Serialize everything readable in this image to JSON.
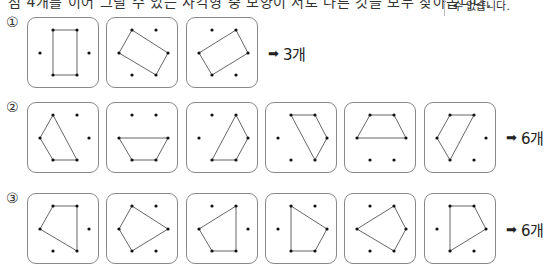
{
  "header": {
    "instruction_partial": "점 4개를 이어 그릴 수 있는 사각형 중 모양이 서로 다른 것을 모두 찾아봅니다.",
    "side_note": "수 없습니다."
  },
  "dot_layout": {
    "description": "6 dots arranged as a hexagon: 0=top-left,1=top-right,2=right,3=bottom-right,4=bottom-left,5=left",
    "points": [
      [
        25,
        12
      ],
      [
        49,
        12
      ],
      [
        61,
        35
      ],
      [
        49,
        57
      ],
      [
        25,
        57
      ],
      [
        12,
        35
      ]
    ]
  },
  "rows": [
    {
      "number": "①",
      "answer_arrow": "➡",
      "answer": "3개",
      "shapes": [
        [
          0,
          1,
          3,
          4
        ],
        [
          0,
          2,
          3,
          5
        ],
        [
          1,
          2,
          4,
          5
        ]
      ]
    },
    {
      "number": "②",
      "answer_arrow": "➡",
      "answer": "6개",
      "shapes": [
        [
          0,
          3,
          4,
          5
        ],
        [
          5,
          2,
          3,
          4
        ],
        [
          1,
          2,
          3,
          4
        ],
        [
          0,
          1,
          2,
          3
        ],
        [
          0,
          1,
          2,
          5
        ],
        [
          0,
          1,
          4,
          5
        ]
      ]
    },
    {
      "number": "③",
      "answer_arrow": "➡",
      "answer": "6개",
      "shapes": [
        [
          0,
          1,
          3,
          5
        ],
        [
          0,
          2,
          4,
          5
        ],
        [
          1,
          3,
          4,
          5
        ],
        [
          0,
          2,
          3,
          4
        ],
        [
          1,
          2,
          3,
          5
        ],
        [
          0,
          1,
          2,
          4
        ]
      ]
    }
  ],
  "colors": {
    "box_border": "#888888",
    "line": "#555555",
    "dot": "#111111"
  }
}
